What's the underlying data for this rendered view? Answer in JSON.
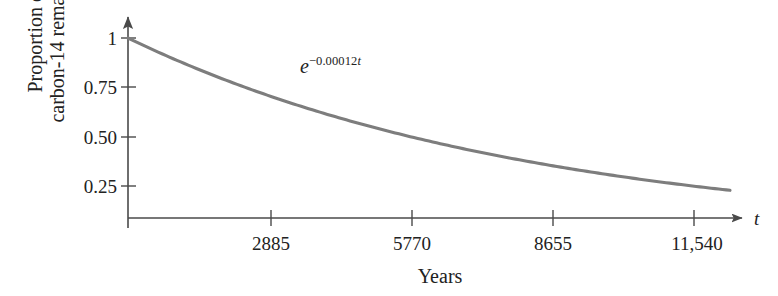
{
  "chart_data": {
    "type": "line",
    "title": "",
    "subtitle": "",
    "xlabel": "Years",
    "ylabel": "Proportion of carbon-14 remaining",
    "ylabel_lines": [
      "Proportion of",
      "carbon-14 remaining"
    ],
    "axis_variable_label": "t",
    "annotation": {
      "base": "e",
      "exponent_sign": "−",
      "exponent_value": "0.00012",
      "exponent_variable": "t",
      "text": "e^(-0.00012t)"
    },
    "equation": "y = e^(-0.00012t)",
    "decay_constant": 0.00012,
    "x": [
      0,
      2885,
      5770,
      8655,
      11540
    ],
    "xticks": [
      2885,
      5770,
      8655,
      11540
    ],
    "xtick_labels": [
      "2885",
      "5770",
      "8655",
      "11,540"
    ],
    "yticks": [
      0.25,
      0.5,
      0.75,
      1
    ],
    "ytick_labels": [
      "0.25",
      "0.50",
      "0.75",
      "1"
    ],
    "values": [
      1.0,
      0.707,
      0.5,
      0.354,
      0.25
    ],
    "series": [
      {
        "name": "Proportion of carbon-14 remaining",
        "color": "#7d7d7d",
        "values": [
          1.0,
          0.707,
          0.5,
          0.354,
          0.25
        ]
      }
    ],
    "xlim": [
      0,
      12500
    ],
    "ylim": [
      0,
      1.08
    ],
    "grid": false,
    "legend": "none",
    "axis_arrows": [
      "x-right",
      "y-up"
    ],
    "curve_color": "#7d7d7d",
    "axis_color": "#4a4a4a"
  },
  "figure": {
    "background": "#ffffff",
    "text_color": "#222222"
  }
}
